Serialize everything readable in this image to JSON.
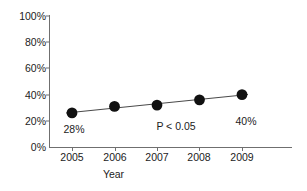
{
  "chart_data": {
    "type": "line",
    "title": "",
    "subtitle": "",
    "xlabel": "Year",
    "ylabel": "",
    "categories": [
      "2005",
      "2006",
      "2007",
      "2008",
      "2009"
    ],
    "x": [
      2005,
      2006,
      2007,
      2008,
      2009
    ],
    "values": [
      26,
      31,
      32,
      36,
      40
    ],
    "series": [
      {
        "name": "percent",
        "values": [
          26,
          31,
          32,
          36,
          40
        ]
      }
    ],
    "ylim": [
      0,
      100
    ],
    "xlim": [
      2004.6,
      2009.6
    ],
    "ytick_labels": [
      "0%",
      "20%",
      "40%",
      "60%",
      "80%",
      "100%"
    ],
    "ytick_values": [
      0,
      20,
      40,
      60,
      80,
      100
    ],
    "xtick_labels": [
      "2005",
      "2006",
      "2007",
      "2008",
      "2009"
    ],
    "grid": false,
    "legend": false,
    "legend_position": "none",
    "marker": "filled-circle",
    "marker_color": "#111111",
    "line_color": "#4a4a4a",
    "axis_color": "#6f6f6f",
    "annotations": [
      {
        "text": "28%",
        "x": 2005.0,
        "y": 18.0,
        "name": "first-point-value-label"
      },
      {
        "text": "P < 0.05",
        "x": 2007.1,
        "y": 14.0,
        "name": "p-value-label"
      },
      {
        "text": "40%",
        "x": 2009.0,
        "y": 19.0,
        "name": "last-point-value-label"
      }
    ]
  },
  "axis": {
    "y_labels": [
      "100%",
      "80%",
      "60%",
      "40%",
      "20%",
      "0%"
    ],
    "x_labels": [
      "2005",
      "2006",
      "2007",
      "2008",
      "2009"
    ],
    "x_title": "Year"
  },
  "annotations": {
    "first_value": "28%",
    "p_value": "P < 0.05",
    "last_value": "40%"
  }
}
